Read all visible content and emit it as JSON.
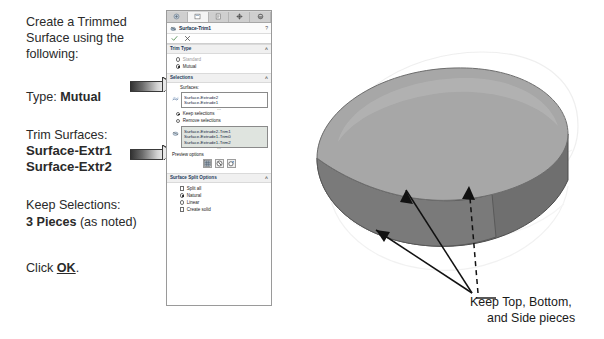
{
  "instructions": {
    "intro": [
      "Create a Trimmed",
      "Surface using the",
      "following:"
    ],
    "type_label": "Type:",
    "type_value": "Mutual",
    "trim_label": "Trim Surfaces:",
    "trim_values": [
      "Surface-Extr1",
      "Surface-Extr2"
    ],
    "keep_label": "Keep Selections:",
    "keep_value_bold": "3 Pieces",
    "keep_value_rest": " (as noted)",
    "click_prefix": "Click ",
    "click_ok": "OK",
    "click_suffix": "."
  },
  "property_manager": {
    "tabs": [
      {
        "name": "feature-manager-tab",
        "icon": "tree-icon"
      },
      {
        "name": "property-manager-tab",
        "icon": "property-panel-icon"
      },
      {
        "name": "configuration-manager-tab",
        "icon": "configuration-icon"
      },
      {
        "name": "dimxpert-manager-tab",
        "icon": "dimxpert-icon"
      },
      {
        "name": "display-manager-tab",
        "icon": "appearance-sphere-icon"
      }
    ],
    "active_tab_index": 1,
    "title": "Surface-Trim1",
    "help_glyph": "?",
    "ok_tooltip": "OK",
    "cancel_tooltip": "Cancel",
    "sections": {
      "trim_type": {
        "header": "Trim Type",
        "options": [
          {
            "label": "Standard",
            "selected": false,
            "disabled": true
          },
          {
            "label": "Mutual",
            "selected": true,
            "disabled": false
          }
        ]
      },
      "selections": {
        "header": "Selections",
        "surfaces_label": "Surfaces:",
        "surfaces": [
          "Surface-Extrude2",
          "Surface-Extrude1"
        ],
        "keep_remove": [
          {
            "label": "Keep selections",
            "selected": true
          },
          {
            "label": "Remove selections",
            "selected": false
          }
        ],
        "pieces": [
          "Surface-Extrude2-Trim1",
          "Surface-Extrude1-Trim0",
          "Surface-Extrude1-Trim2"
        ],
        "preview_label": "Preview options",
        "preview_buttons": [
          {
            "name": "shaded-preview-button",
            "icon": "shaded-grid-icon"
          },
          {
            "name": "zebra-preview-button",
            "icon": "zebra-sphere-icon"
          },
          {
            "name": "curvature-preview-button",
            "icon": "curvature-icon"
          }
        ]
      },
      "surface_split_options": {
        "header": "Surface Split Options",
        "split_all": {
          "label": "Split all",
          "checked": false
        },
        "natural": {
          "label": "Natural",
          "selected": true
        },
        "linear": {
          "label": "Linear",
          "selected": false
        },
        "create_solid": {
          "label": "Create solid",
          "checked": false
        }
      }
    }
  },
  "model": {
    "description": "trimmed-surface-3d-model",
    "top_face_color": "#a6a6a6",
    "side_face_color": "#6f6f6f",
    "bottom_face_color": "#8d8d8d",
    "annotation_arrows": [
      {
        "name": "arrow-to-top-piece",
        "style": "solid"
      },
      {
        "name": "arrow-to-bottom-piece",
        "style": "solid"
      },
      {
        "name": "arrow-to-side-piece",
        "style": "dashed"
      }
    ]
  },
  "caption": {
    "line1": "Keep Top, Bottom,",
    "line2": "and Side pieces"
  }
}
